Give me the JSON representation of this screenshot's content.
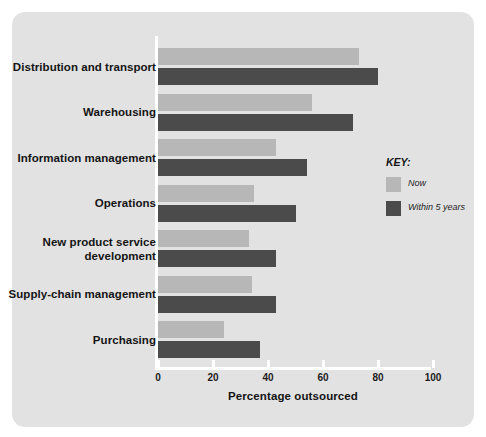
{
  "scan": {
    "top_artifact_text": ""
  },
  "legend": {
    "title": "KEY:",
    "position": "right",
    "entries": [
      {
        "label": "Now",
        "color": "#b7b7b7",
        "name": "now"
      },
      {
        "label": "Within 5 years",
        "color": "#4b4b4b",
        "name": "within-5-years"
      }
    ]
  },
  "axis": {
    "x_title": "Percentage outsourced",
    "ticks": [
      "0",
      "20",
      "40",
      "60",
      "80",
      "100"
    ]
  },
  "colors": {
    "panel_background": "#e2e2e2",
    "page_background": "#ffffff",
    "axis": "#ffffff",
    "now": "#b7b7b7",
    "within_5_years": "#4b4b4b",
    "text": "#141414"
  },
  "chart_data": {
    "type": "bar",
    "orientation": "horizontal",
    "title": "",
    "xlabel": "Percentage outsourced",
    "ylabel": "",
    "xlim": [
      0,
      100
    ],
    "xticks": [
      0,
      20,
      40,
      60,
      80,
      100
    ],
    "grid": false,
    "legend_position": "right",
    "categories": [
      "Distribution and transport",
      "Warehousing",
      "Information management",
      "Operations",
      "New product service development",
      "Supply-chain management",
      "Purchasing"
    ],
    "series": [
      {
        "name": "Now",
        "color": "#b7b7b7",
        "values": [
          73,
          56,
          43,
          35,
          33,
          34,
          24
        ]
      },
      {
        "name": "Within 5 years",
        "color": "#4b4b4b",
        "values": [
          80,
          71,
          54,
          50,
          43,
          43,
          37
        ]
      }
    ]
  }
}
